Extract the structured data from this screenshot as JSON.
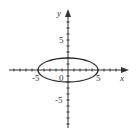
{
  "chart_data": {
    "type": "line",
    "title": "",
    "xlabel": "x",
    "ylabel": "y",
    "xlim": [
      -10,
      10
    ],
    "ylim": [
      -10,
      10
    ],
    "grid": false,
    "tick_step": 1,
    "x_tick_labels": [
      {
        "value": -5,
        "label": "-5"
      },
      {
        "value": 5,
        "label": "5"
      }
    ],
    "y_tick_labels": [
      {
        "value": 5,
        "label": "5"
      },
      {
        "value": -5,
        "label": "-5"
      }
    ],
    "origin_label": "0",
    "series": [
      {
        "name": "ellipse",
        "equation": "x^2/25 + y^2/4 = 1",
        "center": [
          0,
          0
        ],
        "semi_axis_x": 5,
        "semi_axis_y": 2,
        "color": "#333333"
      }
    ]
  },
  "labels": {
    "x_axis": "x",
    "y_axis": "y",
    "origin": "0",
    "x_neg5": "-5",
    "x_pos5": "5",
    "y_pos5": "5",
    "y_neg5": "-5"
  },
  "colors": {
    "axis": "#333333",
    "curve": "#333333",
    "background": "#ffffff"
  }
}
